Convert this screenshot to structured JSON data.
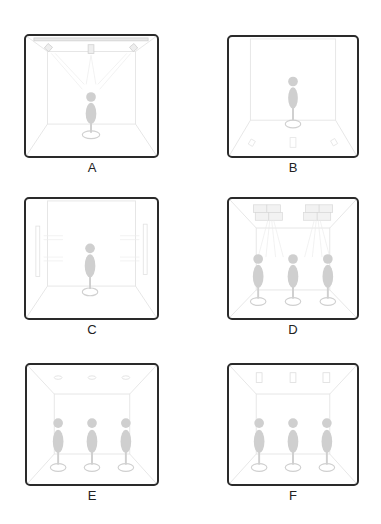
{
  "figure": {
    "panels": [
      {
        "id": "A",
        "label": "A",
        "people": 1,
        "fixtures": "ceiling-track-spotlights",
        "spray": "from-ceiling-down"
      },
      {
        "id": "B",
        "label": "B",
        "people": 1,
        "fixtures": "floor-nozzles",
        "spray": "from-floor-up"
      },
      {
        "id": "C",
        "label": "C",
        "people": 1,
        "fixtures": "side-wall-nozzles",
        "spray": "from-walls-horizontal"
      },
      {
        "id": "D",
        "label": "D",
        "people": 3,
        "fixtures": "ceiling-panel-diffusers",
        "spray": "from-ceiling-angled"
      },
      {
        "id": "E",
        "label": "E",
        "people": 3,
        "fixtures": "ceiling-round-vents",
        "spray": "none-visible"
      },
      {
        "id": "F",
        "label": "F",
        "people": 3,
        "fixtures": "ceiling-rectangular-vents",
        "spray": "none-visible"
      }
    ]
  },
  "colors": {
    "border": "#2a2a2a",
    "figure": "#cfcfcf",
    "lines": "#e4e4e4",
    "label": "#222222"
  }
}
